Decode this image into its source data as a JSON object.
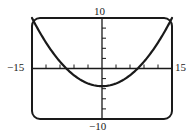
{
  "chart_data": {
    "type": "line",
    "title": "",
    "xlabel": "",
    "ylabel": "",
    "xlim": [
      -15,
      15
    ],
    "ylim": [
      -10,
      10
    ],
    "x_tick_step": 3,
    "y_tick_step": 2,
    "grid": false,
    "legend": null,
    "window_labels": {
      "xmin": "−15",
      "xmax": "15",
      "ymin": "−10",
      "ymax": "10"
    },
    "series": [
      {
        "name": "parabola",
        "equation_estimate": "y = 0.06x^2 - 3.5",
        "x": [
          -15,
          -12,
          -9,
          -6,
          -3,
          0,
          3,
          6,
          9,
          12,
          15
        ],
        "y": [
          10,
          5.14,
          1.36,
          -1.34,
          -2.96,
          -3.5,
          -2.96,
          -1.34,
          1.36,
          5.14,
          10
        ]
      }
    ],
    "annotations": {
      "vertex": [
        0,
        -3.5
      ],
      "x_intercepts": [
        -7.6,
        7.6
      ]
    },
    "colors": {
      "frame": "#1a1a1a",
      "axes": "#1a1a1a",
      "curve": "#1a1a1a",
      "background": "#ffffff"
    }
  }
}
